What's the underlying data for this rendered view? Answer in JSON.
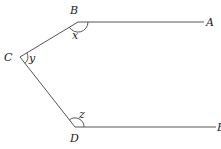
{
  "diagram": {
    "type": "geometry-angles",
    "points": {
      "A": {
        "label": "A",
        "x": 206,
        "y": 22
      },
      "B": {
        "label": "B",
        "x": 78,
        "y": 22
      },
      "C": {
        "label": "C",
        "x": 20,
        "y": 57
      },
      "D": {
        "label": "D",
        "x": 75,
        "y": 127
      },
      "E": {
        "label": "E",
        "x": 218,
        "y": 127
      }
    },
    "segments": [
      {
        "from": "B",
        "to": "A"
      },
      {
        "from": "B",
        "to": "C"
      },
      {
        "from": "C",
        "to": "D"
      },
      {
        "from": "D",
        "to": "E"
      }
    ],
    "angles": [
      {
        "vertex": "B",
        "label": "x"
      },
      {
        "vertex": "C",
        "label": "y"
      },
      {
        "vertex": "D",
        "label": "z"
      }
    ],
    "labels": {
      "A": "A",
      "B": "B",
      "C": "C",
      "D": "D",
      "E": "E",
      "x": "x",
      "y": "y",
      "z": "z"
    },
    "colors": {
      "line": "#555555",
      "text": "#222222",
      "background": "#ffffff"
    }
  }
}
